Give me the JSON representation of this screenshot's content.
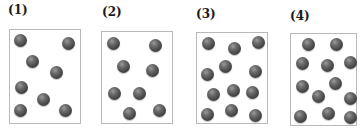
{
  "panels": [
    {
      "label": "(1)",
      "label_pos": [
        8,
        3
      ],
      "box": [
        9,
        29,
        72,
        95
      ],
      "particle_count": 8,
      "particles": [
        [
          20,
          40
        ],
        [
          68,
          43
        ],
        [
          32,
          61
        ],
        [
          56,
          72
        ],
        [
          21,
          87
        ],
        [
          43,
          99
        ],
        [
          20,
          110
        ],
        [
          65,
          110
        ]
      ]
    },
    {
      "label": "(2)",
      "label_pos": [
        102,
        5
      ],
      "box": [
        101,
        31,
        72,
        93
      ],
      "particle_count": 8,
      "particles": [
        [
          113,
          43
        ],
        [
          155,
          45
        ],
        [
          123,
          66
        ],
        [
          152,
          70
        ],
        [
          114,
          93
        ],
        [
          139,
          93
        ],
        [
          129,
          113
        ],
        [
          159,
          110
        ]
      ]
    },
    {
      "label": "(3)",
      "label_pos": [
        196,
        7
      ],
      "box": [
        196,
        32,
        72,
        92
      ],
      "particle_count": 12,
      "particles": [
        [
          208,
          43
        ],
        [
          234,
          48
        ],
        [
          258,
          42
        ],
        [
          225,
          66
        ],
        [
          207,
          74
        ],
        [
          255,
          71
        ],
        [
          213,
          94
        ],
        [
          233,
          90
        ],
        [
          252,
          92
        ],
        [
          207,
          114
        ],
        [
          231,
          110
        ],
        [
          255,
          115
        ]
      ]
    },
    {
      "label": "(4)",
      "label_pos": [
        290,
        9
      ],
      "box": [
        290,
        33,
        67,
        93
      ],
      "particle_count": 12,
      "particles": [
        [
          308,
          44
        ],
        [
          336,
          44
        ],
        [
          302,
          63
        ],
        [
          327,
          65
        ],
        [
          350,
          62
        ],
        [
          302,
          86
        ],
        [
          335,
          83
        ],
        [
          318,
          96
        ],
        [
          350,
          98
        ],
        [
          300,
          116
        ],
        [
          328,
          113
        ],
        [
          350,
          117
        ]
      ]
    }
  ],
  "colors": {
    "particle": "#4a4a4a",
    "box_border": "#b9b9b9",
    "label": "#1a1a1a"
  }
}
